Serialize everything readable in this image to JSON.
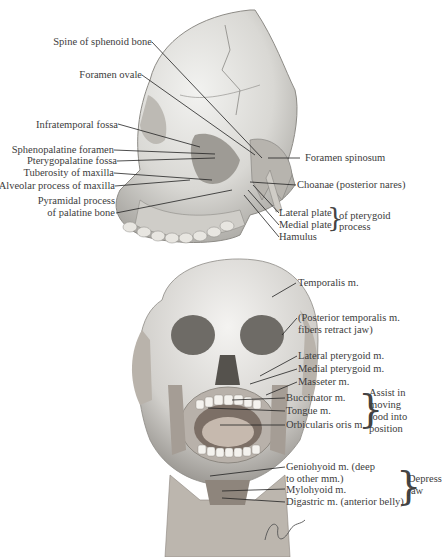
{
  "figure": {
    "top_view": "Lateral view of skull (infratemporal region)",
    "bottom_view": "Anterior view of head with muscles of mastication",
    "signature": "F. Netter M.D."
  },
  "top_labels_left": [
    {
      "id": "spine-sphenoid",
      "text": "Spine of sphenoid bone"
    },
    {
      "id": "foramen-ovale",
      "text": "Foramen ovale"
    },
    {
      "id": "infratemporal-fossa",
      "text": "Infratemporal fossa"
    },
    {
      "id": "sphenopalatine-foramen",
      "text": "Sphenopalatine foramen"
    },
    {
      "id": "pterygopalatine-fossa",
      "text": "Pterygopalatine fossa"
    },
    {
      "id": "tuberosity-maxilla",
      "text": "Tuberosity of maxilla"
    },
    {
      "id": "alveolar-process",
      "text": "Alveolar process of maxilla"
    },
    {
      "id": "pyramidal-process-1",
      "text": "Pyramidal process"
    },
    {
      "id": "pyramidal-process-2",
      "text": "of palatine bone"
    }
  ],
  "top_labels_right": [
    {
      "id": "foramen-spinosum",
      "text": "Foramen spinosum"
    },
    {
      "id": "choanae",
      "text": "Choanae (posterior nares)"
    },
    {
      "id": "lateral-plate",
      "text": "Lateral plate"
    },
    {
      "id": "medial-plate",
      "text": "Medial plate"
    },
    {
      "id": "hamulus",
      "text": "Hamulus"
    }
  ],
  "pterygoid_group": {
    "line1": "of pterygoid",
    "line2": "process"
  },
  "bottom_labels": [
    {
      "id": "temporalis",
      "text": "Temporalis m."
    },
    {
      "id": "post-temporalis-1",
      "text": "(Posterior temporalis m."
    },
    {
      "id": "post-temporalis-2",
      "text": "fibers retract jaw)"
    },
    {
      "id": "lateral-pterygoid",
      "text": "Lateral pterygoid m."
    },
    {
      "id": "medial-pterygoid",
      "text": "Medial pterygoid m."
    },
    {
      "id": "masseter",
      "text": "Masseter m."
    },
    {
      "id": "buccinator",
      "text": "Buccinator m."
    },
    {
      "id": "tongue",
      "text": "Tongue m."
    },
    {
      "id": "orbicularis",
      "text": "Orbicularis oris m."
    },
    {
      "id": "geniohyoid-1",
      "text": "Geniohyoid m. (deep"
    },
    {
      "id": "geniohyoid-2",
      "text": "to other mm.)"
    },
    {
      "id": "mylohyoid",
      "text": "Mylohyoid m."
    },
    {
      "id": "digastric",
      "text": "Digastric m. (anterior belly)"
    }
  ],
  "assist_group": {
    "lines": [
      "Assist in",
      "moving",
      "food into",
      "position"
    ]
  },
  "depress_group": {
    "lines": [
      "Depress",
      "jaw"
    ]
  }
}
